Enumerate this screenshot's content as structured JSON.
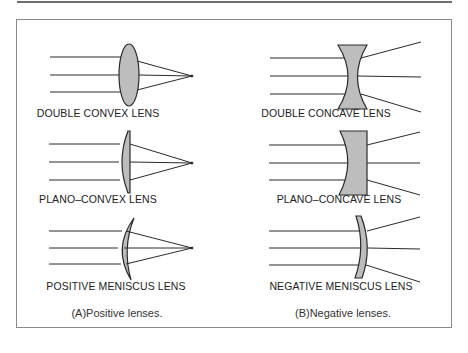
{
  "figure": {
    "colors": {
      "line": "#2a2a2a",
      "lens_fill": "#bdbdbd",
      "frame": "#8a8a8a",
      "top_rule": "#6e6e6e",
      "background": "#ffffff"
    },
    "panels": [
      {
        "id": "A",
        "caption": "(A)Positive lenses.",
        "lenses": [
          {
            "type": "double-convex",
            "label": "DOUBLE CONVEX LENS",
            "rays": "converging"
          },
          {
            "type": "plano-convex",
            "label": "PLANO–CONVEX LENS",
            "rays": "converging"
          },
          {
            "type": "positive-meniscus",
            "label": "POSITIVE MENISCUS LENS",
            "rays": "converging"
          }
        ]
      },
      {
        "id": "B",
        "caption": "(B)Negative lenses.",
        "lenses": [
          {
            "type": "double-concave",
            "label": "DOUBLE CONCAVE LENS",
            "rays": "diverging"
          },
          {
            "type": "plano-concave",
            "label": "PLANO–CONCAVE LENS",
            "rays": "diverging"
          },
          {
            "type": "negative-meniscus",
            "label": "NEGATIVE MENISCUS LENS",
            "rays": "diverging"
          }
        ]
      }
    ]
  }
}
